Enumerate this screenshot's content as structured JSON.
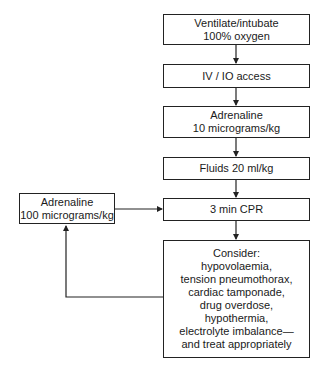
{
  "flowchart": {
    "nodes": [
      {
        "id": "ventilate",
        "lines": [
          "Ventilate/intubate",
          "100% oxygen"
        ]
      },
      {
        "id": "access",
        "lines": [
          "IV / IO access"
        ]
      },
      {
        "id": "adrenaline10",
        "lines": [
          "Adrenaline",
          "10 micrograms/kg"
        ]
      },
      {
        "id": "fluids",
        "lines": [
          "Fluids 20 ml/kg"
        ]
      },
      {
        "id": "cpr",
        "lines": [
          "3 min CPR"
        ]
      },
      {
        "id": "consider",
        "lines": [
          "Consider:",
          "hypovolaemia,",
          "tension pneumothorax,",
          "cardiac tamponade,",
          "drug overdose,",
          "hypothermia,",
          "electrolyte imbalance—",
          "and treat appropriately"
        ]
      },
      {
        "id": "adrenaline100",
        "lines": [
          "Adrenaline",
          "100 micrograms/kg"
        ]
      }
    ],
    "edges": [
      {
        "from": "ventilate",
        "to": "access"
      },
      {
        "from": "access",
        "to": "adrenaline10"
      },
      {
        "from": "adrenaline10",
        "to": "fluids"
      },
      {
        "from": "fluids",
        "to": "cpr"
      },
      {
        "from": "cpr",
        "to": "consider"
      },
      {
        "from": "consider",
        "to": "adrenaline100"
      },
      {
        "from": "adrenaline100",
        "to": "cpr"
      }
    ]
  }
}
